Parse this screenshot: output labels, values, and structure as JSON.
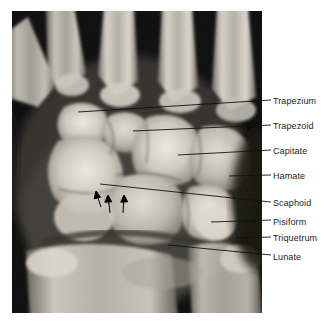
{
  "figure": {
    "kind": "radiograph",
    "modality": "X-ray",
    "view": "posteroanterior wrist radiograph",
    "background_color": "#ffffff",
    "panel": {
      "x": 12,
      "y": 11,
      "width": 250,
      "height": 302,
      "film_base_color": "#0a0a0a"
    }
  },
  "labels": [
    {
      "id": "trapezium",
      "text": "Trapezium",
      "text_x": 273,
      "text_y": 96,
      "leader": {
        "x1": 78,
        "y1": 112,
        "x2": 271,
        "y2": 100
      }
    },
    {
      "id": "trapezoid",
      "text": "Trapezoid",
      "text_x": 273,
      "text_y": 121,
      "leader": {
        "x1": 133,
        "y1": 131,
        "x2": 271,
        "y2": 125
      }
    },
    {
      "id": "capitate",
      "text": "Capitate",
      "text_x": 273,
      "text_y": 146,
      "leader": {
        "x1": 178,
        "y1": 155,
        "x2": 271,
        "y2": 150
      }
    },
    {
      "id": "hamate",
      "text": "Hamate",
      "text_x": 273,
      "text_y": 171,
      "leader": {
        "x1": 229,
        "y1": 176,
        "x2": 271,
        "y2": 175
      }
    },
    {
      "id": "scaphoid",
      "text": "Scaphoid",
      "text_x": 273,
      "text_y": 198,
      "leader": {
        "x1": 100,
        "y1": 184,
        "x2": 271,
        "y2": 202
      }
    },
    {
      "id": "pisiform",
      "text": "Pisiform",
      "text_x": 273,
      "text_y": 217,
      "leader": {
        "x1": 211,
        "y1": 222,
        "x2": 271,
        "y2": 220
      }
    },
    {
      "id": "triquetrum",
      "text": "Triquetrum",
      "text_x": 273,
      "text_y": 233,
      "leader": {
        "x1": 236,
        "y1": 238,
        "x2": 271,
        "y2": 237
      }
    },
    {
      "id": "lunate",
      "text": "Lunate",
      "text_x": 273,
      "text_y": 252,
      "leader": {
        "x1": 168,
        "y1": 245,
        "x2": 271,
        "y2": 255
      }
    }
  ],
  "markers": {
    "description": "three small solid arrows on the radial side of the scaphoid",
    "color": "#000000",
    "arrows": [
      {
        "tip_x": 96,
        "tip_y": 192,
        "tail_x": 101,
        "tail_y": 207
      },
      {
        "tip_x": 108,
        "tip_y": 196,
        "tail_x": 110,
        "tail_y": 213
      },
      {
        "tip_x": 124,
        "tip_y": 196,
        "tail_x": 123,
        "tail_y": 213
      }
    ]
  },
  "palette": {
    "label_text": "#1d1d1d",
    "leader_line": "#111111",
    "bone_bright": "#e9e5dd",
    "bone_mid": "#bdb8ae",
    "bone_dim": "#8d8881",
    "soft_tissue": "#5c5853",
    "film_dark": "#0c0c0c"
  }
}
